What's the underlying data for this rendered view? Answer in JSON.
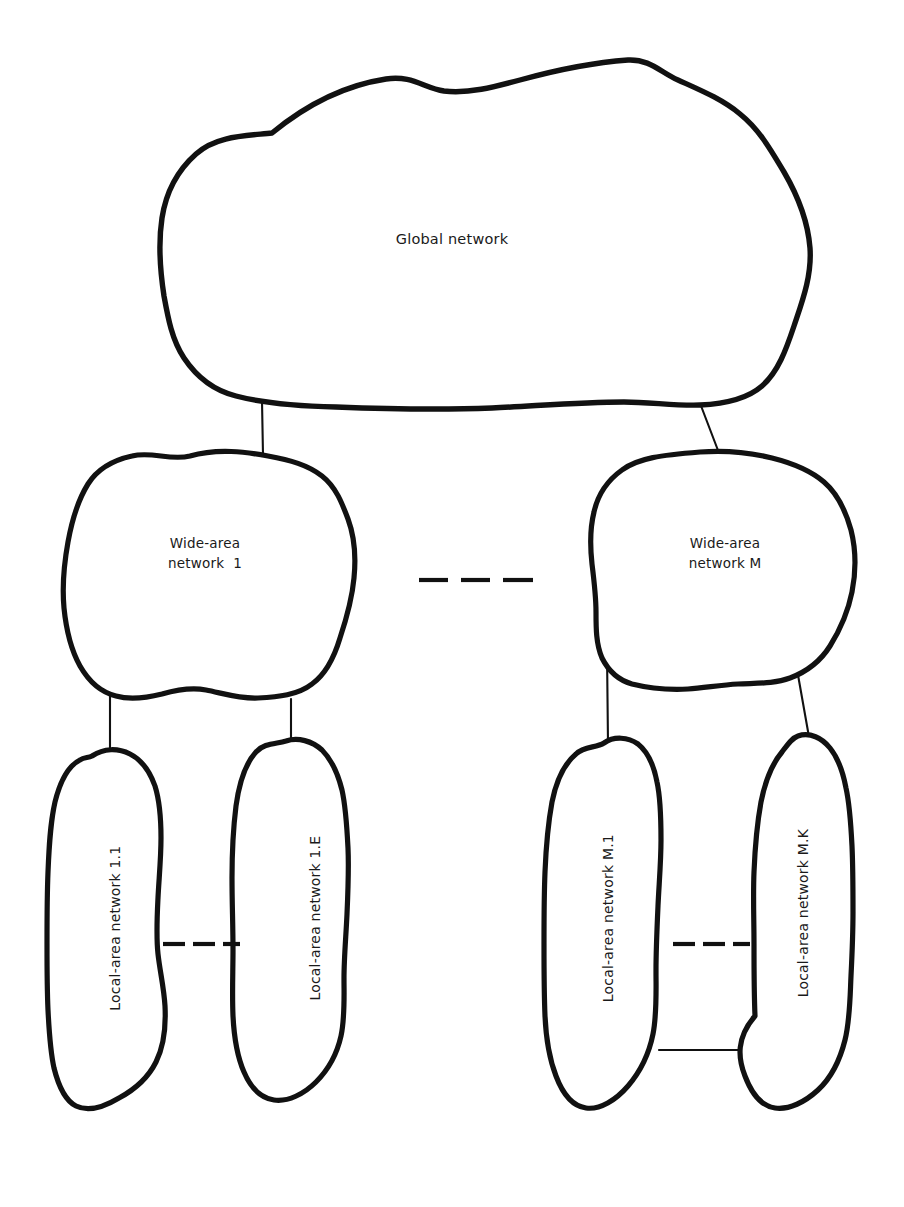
{
  "diagram": {
    "type": "hierarchical-network-cloud-diagram",
    "title_text_present": false,
    "background_color": "#ffffff",
    "line_color": "#111111",
    "text_color": "#1a1a1a",
    "levels": [
      {
        "level": 1,
        "name": "global",
        "nodes": [
          {
            "id": "global-network",
            "label": "Global network"
          }
        ]
      },
      {
        "level": 2,
        "name": "wide-area",
        "nodes": [
          {
            "id": "wan-1",
            "label_line1": "Wide-area",
            "label_line2": "network  1"
          },
          {
            "id": "wan-m",
            "label_line1": "Wide-area",
            "label_line2": "network M"
          }
        ]
      },
      {
        "level": 3,
        "name": "local-area",
        "nodes": [
          {
            "id": "lan-1-1",
            "label": "Local-area network 1.1"
          },
          {
            "id": "lan-1-e",
            "label": "Local-area network 1.E"
          },
          {
            "id": "lan-m-1",
            "label": "Local-area network M.1"
          },
          {
            "id": "lan-m-k",
            "label": "Local-area network M.K"
          }
        ]
      }
    ],
    "ellipsis_markers": [
      {
        "id": "ellipsis-between-wans",
        "dash_count": 3,
        "orientation": "horizontal"
      },
      {
        "id": "ellipsis-between-lans-1",
        "dash_count": 3,
        "orientation": "horizontal"
      },
      {
        "id": "ellipsis-between-lans-m",
        "dash_count": 3,
        "orientation": "horizontal"
      }
    ],
    "connectors": [
      {
        "id": "link-global-to-wan-1",
        "from": "global-network",
        "to": "wan-1",
        "style": "solid"
      },
      {
        "id": "link-global-to-wan-m",
        "from": "global-network",
        "to": "wan-m",
        "style": "solid"
      },
      {
        "id": "link-wan-1-to-lan-1-1",
        "from": "wan-1",
        "to": "lan-1-1",
        "style": "solid"
      },
      {
        "id": "link-wan-1-to-lan-1-e",
        "from": "wan-1",
        "to": "lan-1-e",
        "style": "solid"
      },
      {
        "id": "link-wan-m-to-lan-m-1",
        "from": "wan-m",
        "to": "lan-m-1",
        "style": "solid"
      },
      {
        "id": "link-wan-m-to-lan-m-k",
        "from": "wan-m",
        "to": "lan-m-k",
        "style": "solid"
      },
      {
        "id": "link-lan-m-1-to-lan-m-k",
        "from": "lan-m-1",
        "to": "lan-m-k",
        "style": "solid"
      }
    ]
  }
}
